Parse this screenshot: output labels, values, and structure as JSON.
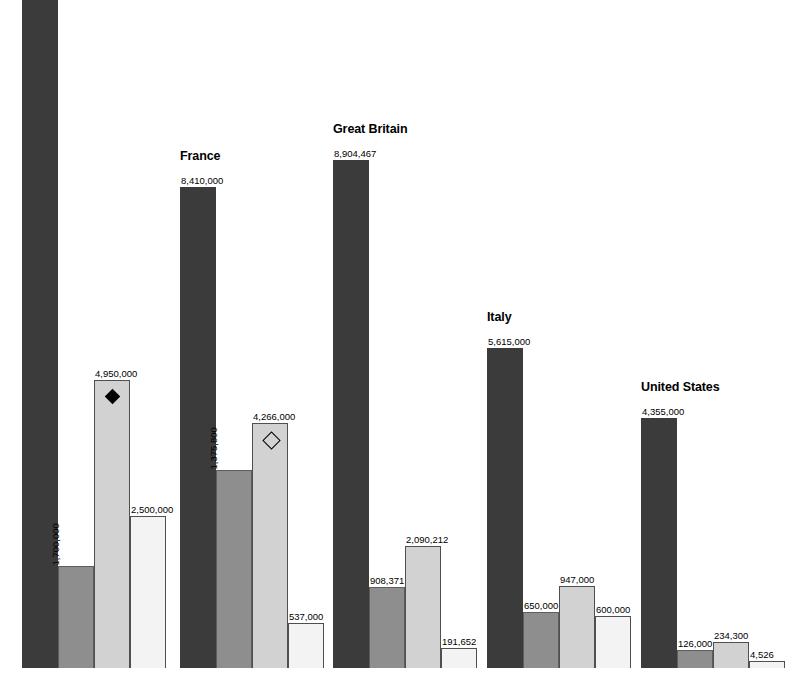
{
  "chart_data": {
    "type": "bar",
    "title": "",
    "xlabel": "",
    "ylabel": "",
    "grid": false,
    "legend_position": "none",
    "value_axis_max": 8904467,
    "categories": [
      "",
      "France",
      "Great Britain",
      "Italy",
      "United States"
    ],
    "series": [
      {
        "name": "series-1",
        "shade": "#3b3b3b",
        "values": [
          11000000,
          8410000,
          8904467,
          5615000,
          4355000
        ]
      },
      {
        "name": "series-2",
        "shade": "#8e8e8e",
        "values": [
          1700000,
          1375800,
          908371,
          650000,
          126000
        ]
      },
      {
        "name": "series-3",
        "shade": "#d2d2d2",
        "values": [
          4950000,
          4266000,
          2090212,
          947000,
          234300
        ]
      },
      {
        "name": "series-4",
        "shade": "#f3f3f3",
        "values": [
          2500000,
          537000,
          191652,
          600000,
          4526
        ]
      }
    ],
    "groups": [
      {
        "title": "",
        "title_visible": false,
        "left": 22,
        "bar_width": 36,
        "bars": [
          {
            "value": 11000000,
            "label": "",
            "label_visible": false,
            "shade_class": "s0",
            "height_px": 683,
            "label_style": "none",
            "marker": "none"
          },
          {
            "value": 1700000,
            "label": "1,700,000",
            "label_visible": true,
            "shade_class": "s1",
            "height_px": 102,
            "label_style": "rotated",
            "marker": "none"
          },
          {
            "value": 4950000,
            "label": "4,950,000",
            "label_visible": true,
            "shade_class": "s2",
            "height_px": 288,
            "label_style": "above",
            "marker": "filled"
          },
          {
            "value": 2500000,
            "label": "2,500,000",
            "label_visible": true,
            "shade_class": "s3",
            "height_px": 152,
            "label_style": "above",
            "marker": "none"
          }
        ]
      },
      {
        "title": "France",
        "title_visible": true,
        "left": 180,
        "bar_width": 36,
        "bars": [
          {
            "value": 8410000,
            "label": "8,410,000",
            "label_visible": true,
            "shade_class": "s0",
            "height_px": 481,
            "label_style": "above",
            "marker": "none"
          },
          {
            "value": 1375800,
            "label": "1,375,800",
            "label_visible": true,
            "shade_class": "s1",
            "height_px": 198,
            "label_style": "rotated",
            "marker": "none"
          },
          {
            "value": 4266000,
            "label": "4,266,000",
            "label_visible": true,
            "shade_class": "s2",
            "height_px": 245,
            "label_style": "above",
            "marker": "hollow"
          },
          {
            "value": 537000,
            "label": "537,000",
            "label_visible": true,
            "shade_class": "s3",
            "height_px": 45,
            "label_style": "above",
            "marker": "none"
          }
        ]
      },
      {
        "title": "Great Britain",
        "title_visible": true,
        "left": 333,
        "bar_width": 36,
        "bars": [
          {
            "value": 8904467,
            "label": "8,904,467",
            "label_visible": true,
            "shade_class": "s0",
            "height_px": 508,
            "label_style": "above",
            "marker": "none"
          },
          {
            "value": 908371,
            "label": "908,371",
            "label_visible": true,
            "shade_class": "s1",
            "height_px": 81,
            "label_style": "above",
            "marker": "none"
          },
          {
            "value": 2090212,
            "label": "2,090,212",
            "label_visible": true,
            "shade_class": "s2",
            "height_px": 122,
            "label_style": "above",
            "marker": "none"
          },
          {
            "value": 191652,
            "label": "191,652",
            "label_visible": true,
            "shade_class": "s3",
            "height_px": 20,
            "label_style": "above",
            "marker": "none"
          }
        ]
      },
      {
        "title": "Italy",
        "title_visible": true,
        "left": 487,
        "bar_width": 36,
        "bars": [
          {
            "value": 5615000,
            "label": "5,615,000",
            "label_visible": true,
            "shade_class": "s0",
            "height_px": 320,
            "label_style": "above",
            "marker": "none"
          },
          {
            "value": 650000,
            "label": "650,000",
            "label_visible": true,
            "shade_class": "s1",
            "height_px": 56,
            "label_style": "above",
            "marker": "none"
          },
          {
            "value": 947000,
            "label": "947,000",
            "label_visible": true,
            "shade_class": "s2",
            "height_px": 82,
            "label_style": "above",
            "marker": "none"
          },
          {
            "value": 600000,
            "label": "600,000",
            "label_visible": true,
            "shade_class": "s3",
            "height_px": 52,
            "label_style": "above",
            "marker": "none"
          }
        ]
      },
      {
        "title": "United States",
        "title_visible": true,
        "left": 641,
        "bar_width": 36,
        "bars": [
          {
            "value": 4355000,
            "label": "4,355,000",
            "label_visible": true,
            "shade_class": "s0",
            "height_px": 250,
            "label_style": "above",
            "marker": "none"
          },
          {
            "value": 126000,
            "label": "126,000",
            "label_visible": true,
            "shade_class": "s1",
            "height_px": 18,
            "label_style": "above",
            "marker": "none"
          },
          {
            "value": 234300,
            "label": "234,300",
            "label_visible": true,
            "shade_class": "s2",
            "height_px": 26,
            "label_style": "above",
            "marker": "none"
          },
          {
            "value": 4526,
            "label": "4,526",
            "label_visible": true,
            "shade_class": "s3",
            "height_px": 7,
            "label_style": "above",
            "marker": "none"
          }
        ]
      }
    ]
  }
}
